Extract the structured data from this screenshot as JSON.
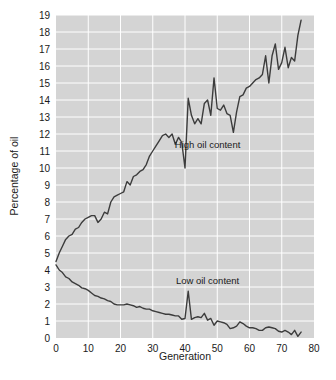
{
  "chart_data": {
    "type": "line",
    "title": "",
    "xlabel": "Generation",
    "ylabel": "Percentage of oil",
    "xlim": [
      0,
      80
    ],
    "ylim": [
      0,
      19
    ],
    "xticks": [
      0,
      10,
      20,
      30,
      40,
      50,
      60,
      70,
      80
    ],
    "yticks": [
      0,
      1,
      2,
      3,
      4,
      5,
      6,
      7,
      8,
      9,
      10,
      11,
      12,
      13,
      14,
      15,
      16,
      17,
      18,
      19
    ],
    "grid": true,
    "grid_color": "#ffffff",
    "plot_background": "#d4d4d4",
    "legend_position": "inline-annotations",
    "line_color": "#3c3c3c",
    "annotations": [
      {
        "text": "High oil content",
        "x": 47.0,
        "y": 11.2
      },
      {
        "text": "Low oil content",
        "x": 47.0,
        "y": 3.15
      }
    ],
    "series": [
      {
        "name": "High oil content",
        "x": [
          0,
          1,
          2,
          3,
          4,
          5,
          6,
          7,
          8,
          9,
          10,
          11,
          12,
          13,
          14,
          15,
          16,
          17,
          18,
          19,
          20,
          21,
          22,
          23,
          24,
          25,
          26,
          27,
          28,
          29,
          30,
          31,
          32,
          33,
          34,
          35,
          36,
          37,
          38,
          39,
          40,
          41,
          42,
          43,
          44,
          45,
          46,
          47,
          48,
          49,
          50,
          51,
          52,
          53,
          54,
          55,
          56,
          57,
          58,
          59,
          60,
          61,
          62,
          63,
          64,
          65,
          66,
          67,
          68,
          69,
          70,
          71,
          72,
          73,
          74,
          75,
          76
        ],
        "values": [
          4.5,
          5.0,
          5.4,
          5.8,
          6.0,
          6.1,
          6.4,
          6.5,
          6.8,
          7.0,
          7.1,
          7.2,
          7.2,
          6.8,
          7.0,
          7.4,
          7.3,
          8.0,
          8.3,
          8.4,
          8.5,
          8.6,
          9.2,
          9.0,
          9.5,
          9.6,
          9.8,
          9.9,
          10.2,
          10.7,
          11.0,
          11.3,
          11.6,
          11.9,
          12.0,
          11.8,
          12.0,
          11.4,
          11.8,
          11.5,
          10.0,
          14.1,
          13.1,
          12.6,
          12.9,
          12.6,
          13.8,
          14.0,
          13.1,
          15.3,
          13.5,
          13.4,
          13.7,
          13.2,
          13.1,
          12.1,
          13.3,
          14.2,
          14.3,
          14.7,
          14.8,
          15.0,
          15.2,
          15.3,
          15.5,
          16.6,
          15.0,
          16.6,
          17.3,
          15.8,
          16.2,
          17.1,
          15.9,
          16.5,
          16.3,
          17.8,
          18.7
        ]
      },
      {
        "name": "Low oil content",
        "x": [
          0,
          1,
          2,
          3,
          4,
          5,
          6,
          7,
          8,
          9,
          10,
          11,
          12,
          13,
          14,
          15,
          16,
          17,
          18,
          19,
          20,
          21,
          22,
          23,
          24,
          25,
          26,
          27,
          28,
          29,
          30,
          31,
          32,
          33,
          34,
          35,
          36,
          37,
          38,
          39,
          40,
          41,
          42,
          43,
          44,
          45,
          46,
          47,
          48,
          49,
          50,
          51,
          52,
          53,
          54,
          55,
          56,
          57,
          58,
          59,
          60,
          61,
          62,
          63,
          64,
          65,
          66,
          67,
          68,
          69,
          70,
          71,
          72,
          73,
          74,
          75,
          76
        ],
        "values": [
          4.3,
          4.0,
          3.85,
          3.6,
          3.5,
          3.3,
          3.2,
          3.1,
          2.95,
          2.9,
          2.8,
          2.65,
          2.5,
          2.45,
          2.35,
          2.3,
          2.2,
          2.15,
          2.0,
          1.95,
          1.95,
          1.95,
          2.0,
          1.95,
          1.9,
          1.8,
          1.85,
          1.75,
          1.7,
          1.7,
          1.6,
          1.55,
          1.5,
          1.45,
          1.4,
          1.4,
          1.35,
          1.3,
          1.3,
          1.1,
          1.15,
          2.75,
          1.1,
          1.2,
          1.25,
          1.2,
          1.45,
          1.05,
          1.15,
          0.75,
          1.0,
          0.95,
          0.9,
          0.8,
          0.55,
          0.6,
          0.7,
          0.95,
          0.85,
          0.7,
          0.6,
          0.6,
          0.55,
          0.45,
          0.45,
          0.6,
          0.65,
          0.6,
          0.55,
          0.4,
          0.35,
          0.45,
          0.35,
          0.2,
          0.45,
          0.1,
          0.35
        ]
      }
    ]
  }
}
